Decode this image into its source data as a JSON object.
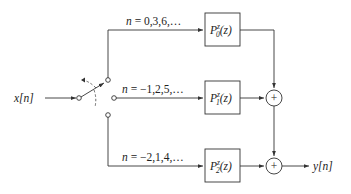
{
  "diagram": {
    "type": "polyphase-decomposition-block-diagram",
    "input": {
      "label": "x[n]"
    },
    "output": {
      "label": "y[n]"
    },
    "switch": {
      "type": "commutator",
      "positions": 3
    },
    "branches": [
      {
        "index": "0",
        "condition": "n = 0,3,6,…",
        "block": {
          "name": "P",
          "superscript": "z",
          "subscript": "0",
          "arg": "(z)"
        }
      },
      {
        "index": "1",
        "condition": "n = −1,2,5,…",
        "block": {
          "name": "P",
          "superscript": "z",
          "subscript": "1",
          "arg": "(z)"
        }
      },
      {
        "index": "2",
        "condition": "n = −2,1,4,…",
        "block": {
          "name": "P",
          "superscript": "z",
          "subscript": "2",
          "arg": "(z)"
        }
      }
    ],
    "adders": [
      {
        "symbol": "+"
      },
      {
        "symbol": "+"
      }
    ]
  }
}
